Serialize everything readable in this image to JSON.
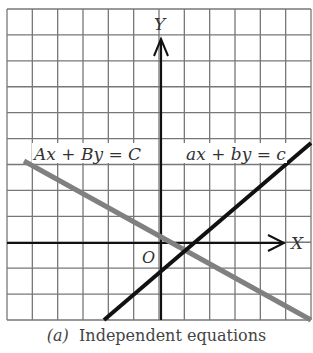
{
  "figure": {
    "axes": {
      "x_label": "X",
      "y_label": "Y",
      "origin_label": "O"
    },
    "grid": {
      "left": 7,
      "top": 9,
      "right": 311,
      "bottom": 320,
      "cols": 12,
      "rows": 12,
      "color": "#777777"
    },
    "lines": [
      {
        "name": "Ax + By = C",
        "label": "Ax + By = C",
        "color": "#808080",
        "x1": 24,
        "y1": 161,
        "x2": 311,
        "y2": 320
      },
      {
        "name": "ax + by = c",
        "label": "ax + by = c",
        "color": "#111111",
        "x1": 104,
        "y1": 320,
        "x2": 311,
        "y2": 143
      }
    ]
  },
  "caption": {
    "part": "(a)",
    "text": "Independent equations"
  }
}
